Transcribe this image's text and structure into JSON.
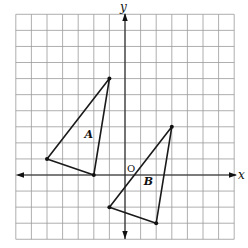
{
  "diagram": {
    "type": "coordinate-grid",
    "grid": {
      "x_min": -7,
      "x_max": 7,
      "y_min": -4,
      "y_max": 10,
      "origin_px": [
        125,
        175
      ],
      "cell_w": 15.6,
      "cell_h": 16.07,
      "line_color": "#9a9a9a"
    },
    "axes": {
      "x_label": "x",
      "y_label": "y",
      "origin_label": "O"
    },
    "shapes": [
      {
        "name": "A",
        "label": "A",
        "vertices": [
          [
            -1,
            6
          ],
          [
            -5,
            1
          ],
          [
            -2,
            0
          ]
        ],
        "label_pos": [
          -2.6,
          2.3
        ]
      },
      {
        "name": "B",
        "label": "B",
        "vertices": [
          [
            3,
            3
          ],
          [
            -1,
            -2
          ],
          [
            2,
            -3
          ]
        ],
        "label_pos": [
          1.2,
          -0.6
        ]
      }
    ]
  }
}
